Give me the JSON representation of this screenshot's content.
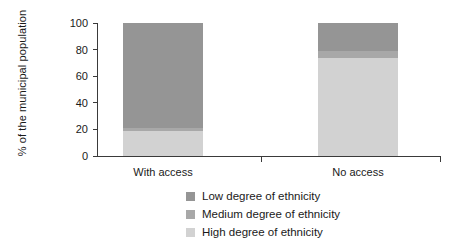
{
  "chart_data": {
    "type": "bar",
    "subtype": "stacked-100-percent",
    "title": "",
    "xlabel": "",
    "ylabel": "% of the municipal population",
    "categories": [
      "With access",
      "No access"
    ],
    "ylim": [
      0,
      100
    ],
    "yticks": [
      0,
      20,
      40,
      60,
      80,
      100
    ],
    "ytick_labels": [
      "0",
      "20",
      "40",
      "60",
      "80",
      "100"
    ],
    "grid": false,
    "legend_position": "bottom-center",
    "series": [
      {
        "name": "Low degree of ethnicity",
        "color": "#959595",
        "values": [
          79,
          21
        ]
      },
      {
        "name": "Medium degree of ethnicity",
        "color": "#a8a8a8",
        "values": [
          2,
          5
        ]
      },
      {
        "name": "High degree of ethnicity",
        "color": "#d2d2d2",
        "values": [
          19,
          74
        ]
      }
    ],
    "stack_order_bottom_to_top": [
      "High degree of ethnicity",
      "Medium degree of ethnicity",
      "Low degree of ethnicity"
    ],
    "axis_color": "#3a3a3a",
    "background_color": "#ffffff"
  },
  "legend": {
    "items": [
      {
        "label": "Low degree of ethnicity",
        "color": "#959595"
      },
      {
        "label": "Medium degree of ethnicity",
        "color": "#a8a8a8"
      },
      {
        "label": "High degree of ethnicity",
        "color": "#d2d2d2"
      }
    ]
  }
}
